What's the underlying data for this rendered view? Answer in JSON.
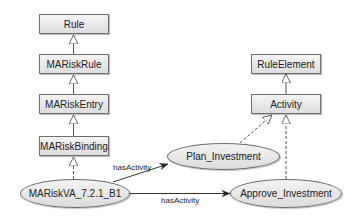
{
  "diagram": {
    "classes": [
      {
        "id": "rule",
        "label": "Rule"
      },
      {
        "id": "mariskrule",
        "label": "MARiskRule"
      },
      {
        "id": "mariskentry",
        "label": "MARiskEntry"
      },
      {
        "id": "mariskbinding",
        "label": "MARiskBinding"
      },
      {
        "id": "ruleelement",
        "label": "RuleElement"
      },
      {
        "id": "activity",
        "label": "Activity"
      }
    ],
    "instances": [
      {
        "id": "mariskva",
        "label": "MARiskVA_7.2.1_B1"
      },
      {
        "id": "plan",
        "label": "Plan_Investment"
      },
      {
        "id": "approve",
        "label": "Approve_Investment"
      }
    ],
    "edges": [
      {
        "from": "MARiskRule",
        "to": "Rule",
        "type": "generalization"
      },
      {
        "from": "MARiskEntry",
        "to": "MARiskRule",
        "type": "generalization"
      },
      {
        "from": "MARiskBinding",
        "to": "MARiskEntry",
        "type": "generalization"
      },
      {
        "from": "MARiskVA_7.2.1_B1",
        "to": "MARiskBinding",
        "type": "instance-of"
      },
      {
        "from": "Activity",
        "to": "RuleElement",
        "type": "generalization"
      },
      {
        "from": "Plan_Investment",
        "to": "Activity",
        "type": "instance-of"
      },
      {
        "from": "Approve_Investment",
        "to": "Activity",
        "type": "instance-of"
      },
      {
        "from": "MARiskVA_7.2.1_B1",
        "to": "Plan_Investment",
        "type": "association",
        "label": "hasActivity"
      },
      {
        "from": "MARiskVA_7.2.1_B1",
        "to": "Approve_Investment",
        "type": "association",
        "label": "hasActivity"
      }
    ],
    "edge_labels": {
      "upper": "hasActivity",
      "lower": "hasActivity"
    }
  }
}
